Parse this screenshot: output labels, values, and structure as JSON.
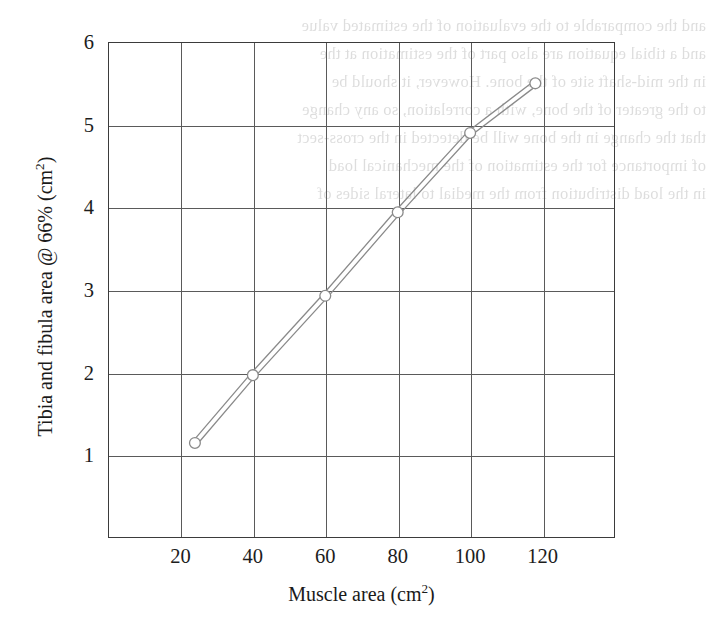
{
  "figure": {
    "axis_color": "#3b3b3b",
    "grid_color": "#5a5a5a",
    "series_color": "#8a8a8a",
    "marker_fill": "#ffffff"
  },
  "axes": {
    "x_title_main": "Muscle area (cm",
    "x_title_sup": "2",
    "x_title_tail": ")",
    "y_title_main": "Tibia and fibula area @ 66% (cm",
    "y_title_sup": "2",
    "y_title_tail": ")",
    "x_ticks": [
      "20",
      "40",
      "60",
      "80",
      "100",
      "120"
    ],
    "y_ticks": [
      "6",
      "5",
      "4",
      "3",
      "2",
      "1"
    ]
  },
  "bleed_through": {
    "lines": [
      "and the comparable to the evaluation of the estimated value",
      "and a tibial equation are also part of the estimation at the",
      "in the mid-shaft site of the bone. However, it should be",
      "to the greater of the bone, with a correlation, so any change",
      "that the change in the bone will be detected in the cross-sect",
      "of importance for the estimation of the mechanical load",
      "in the load distribution from the medial to lateral sides of"
    ]
  },
  "chart_data": {
    "type": "line",
    "title": "",
    "xlabel": "Muscle area (cm^2)",
    "ylabel": "Tibia and fibula area @ 66% (cm^2)",
    "xlim": [
      0,
      140
    ],
    "ylim": [
      0,
      6
    ],
    "grid": true,
    "legend": "none",
    "marker": "open-circle",
    "line_style": "double-parallel-band",
    "series": [
      {
        "name": "Tibia and fibula area vs muscle area",
        "x": [
          24,
          40,
          60,
          80,
          100,
          118
        ],
        "y": [
          1.15,
          1.97,
          2.93,
          3.94,
          4.9,
          5.5
        ]
      }
    ],
    "x_tick_values": [
      20,
      40,
      60,
      80,
      100,
      120
    ],
    "y_tick_values": [
      1,
      2,
      3,
      4,
      5,
      6
    ]
  }
}
